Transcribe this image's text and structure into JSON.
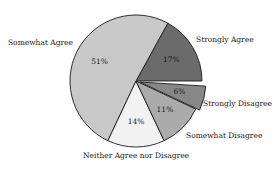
{
  "chart_data": {
    "type": "pie",
    "title": "",
    "start_angle_deg": 0,
    "direction": "counterclockwise",
    "slices": [
      {
        "label": "Strongly Agree",
        "value": 17,
        "display": "17%",
        "color": "#6b6b6b",
        "exploded": false
      },
      {
        "label": "Somewhat Agree",
        "value": 51,
        "display": "51%",
        "color": "#c8c8c8",
        "exploded": false
      },
      {
        "label": "Neither Agree nor Disagree",
        "value": 14,
        "display": "14%",
        "color": "#f2f2f2",
        "exploded": false
      },
      {
        "label": "Somewhat Disagree",
        "value": 11,
        "display": "11%",
        "color": "#ababab",
        "exploded": false
      },
      {
        "label": "Strongly Disagree",
        "value": 6,
        "display": "6%",
        "color": "#888888",
        "exploded": true
      }
    ]
  }
}
